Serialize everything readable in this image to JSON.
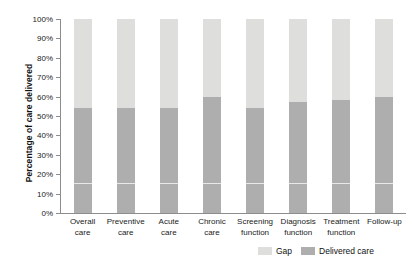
{
  "chart_data": {
    "type": "bar",
    "subtype": "stacked-column-100",
    "title": "",
    "xlabel": "",
    "ylabel": "Percentage of care delivered",
    "ylim": [
      0,
      100
    ],
    "ytick_labels": [
      "100%",
      "90%",
      "80%",
      "70%",
      "60%",
      "50%",
      "40%",
      "30%",
      "20%",
      "10%",
      "0%"
    ],
    "ytick_values": [
      100,
      90,
      80,
      70,
      60,
      50,
      40,
      30,
      20,
      10,
      0
    ],
    "grid": false,
    "legend_position": "bottom-right",
    "categories": [
      "Overall care",
      "Preventive care",
      "Acute care",
      "Chronic care",
      "Screening function",
      "Diagnosis function",
      "Treatment function",
      "Follow-up"
    ],
    "category_lines": [
      [
        "Overall",
        "care"
      ],
      [
        "Preventive",
        "care"
      ],
      [
        "Acute",
        "care"
      ],
      [
        "Chronic",
        "care"
      ],
      [
        "Screening",
        "function"
      ],
      [
        "Diagnosis",
        "function"
      ],
      [
        "Treatment",
        "function"
      ],
      [
        "Follow-up",
        ""
      ]
    ],
    "series": [
      {
        "name": "Gap",
        "color": "#dededd",
        "values": [
          46,
          46,
          46,
          40,
          46,
          43,
          42,
          40
        ]
      },
      {
        "name": "Delivered care",
        "color": "#aeaeae",
        "values": [
          54,
          54,
          54,
          60,
          54,
          57,
          58,
          60
        ]
      }
    ]
  },
  "legend": {
    "items": [
      {
        "label": "Gap",
        "color": "#dededd"
      },
      {
        "label": "Delivered care",
        "color": "#aeaeae"
      }
    ]
  }
}
